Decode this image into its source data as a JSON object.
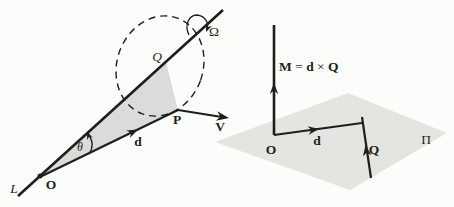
{
  "figure_type": "vector-moment-diagram",
  "colors": {
    "ink": "#1e1e1e",
    "triangle_fill": "#dbdbd9",
    "plane_fill": "#e4e4e1",
    "background": "#fcfcfa"
  },
  "left_diagram": {
    "line_label": "L",
    "origin_label": "O",
    "point_p_label": "P",
    "point_q_label": "Q",
    "vector_d_label": "d",
    "vector_v_label": "V",
    "angle_label": "θ",
    "rotation_label": "Ω"
  },
  "right_diagram": {
    "origin_label": "O",
    "vector_d_label": "d",
    "vector_q_label": "Q",
    "plane_label": "Π",
    "moment_equation": {
      "m": "M",
      "equals": " = ",
      "d": "d",
      "times": " × ",
      "q": "Q"
    }
  }
}
